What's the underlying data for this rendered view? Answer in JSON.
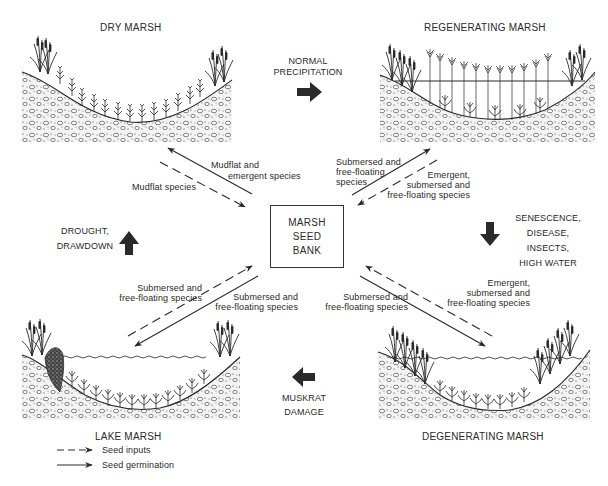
{
  "diagram": {
    "type": "cycle",
    "center": {
      "label_lines": [
        "MARSH",
        "SEED",
        "BANK"
      ]
    },
    "stages": {
      "dry": {
        "title": "DRY MARSH"
      },
      "regenerating": {
        "title": "REGENERATING MARSH"
      },
      "degenerating": {
        "title": "DEGENERATING MARSH"
      },
      "lake": {
        "title": "LAKE MARSH"
      }
    },
    "transitions": {
      "dry_to_regenerating": {
        "lines": [
          "NORMAL",
          "PRECIPITATION"
        ],
        "direction": "right"
      },
      "regenerating_to_degenerating": {
        "lines": [
          "SENESCENCE,",
          "DISEASE,",
          "INSECTS,",
          "HIGH WATER"
        ],
        "direction": "down"
      },
      "degenerating_to_lake": {
        "lines": [
          "MUSKRAT",
          "DAMAGE"
        ],
        "direction": "left"
      },
      "lake_to_dry": {
        "lines": [
          "DROUGHT,",
          "DRAWDOWN"
        ],
        "direction": "up"
      }
    },
    "flows": {
      "dry_germination": {
        "lines": [
          "Mudflat and",
          "emergent species"
        ],
        "style": "solid",
        "from": "seed bank",
        "to": "dry marsh"
      },
      "dry_input": {
        "lines": [
          "Mudflat species"
        ],
        "style": "dashed",
        "from": "dry marsh",
        "to": "seed bank"
      },
      "regen_germination": {
        "lines": [
          "Submersed and",
          "free-floating",
          "species"
        ],
        "style": "solid",
        "from": "seed bank",
        "to": "regenerating marsh"
      },
      "regen_input": {
        "lines": [
          "Emergent,",
          "submersed and",
          "free-floating species"
        ],
        "style": "dashed",
        "from": "regenerating marsh",
        "to": "seed bank"
      },
      "lake_input": {
        "lines": [
          "Submersed and",
          "free-floating species"
        ],
        "style": "dashed",
        "from": "lake marsh",
        "to": "seed bank"
      },
      "lake_germination": {
        "lines": [
          "Submersed and",
          "free-floating species"
        ],
        "style": "solid",
        "from": "seed bank",
        "to": "lake marsh"
      },
      "degen_germination": {
        "lines": [
          "Submersed and",
          "free-floating species"
        ],
        "style": "solid",
        "from": "seed bank",
        "to": "degenerating marsh"
      },
      "degen_input": {
        "lines": [
          "Emergent,",
          "submersed and",
          "free-floating species"
        ],
        "style": "dashed",
        "from": "degenerating marsh",
        "to": "seed bank"
      }
    },
    "legend": [
      {
        "style": "dashed",
        "label": "Seed inputs"
      },
      {
        "style": "solid",
        "label": "Seed germination"
      }
    ],
    "colors": {
      "ink": "#2a2a2a",
      "background": "#ffffff"
    }
  }
}
